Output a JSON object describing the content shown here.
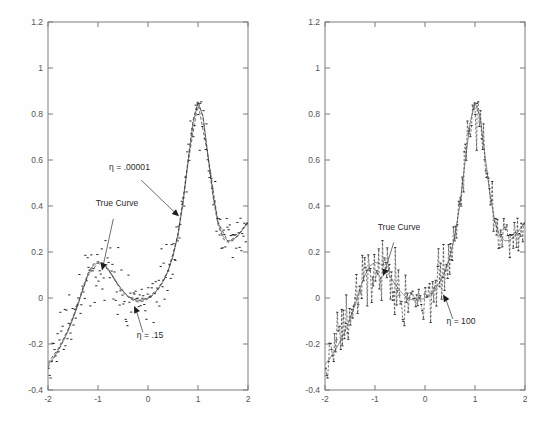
{
  "figure": {
    "title": "",
    "background_color": "#fefefe",
    "panel_count": 2
  },
  "chart_data": [
    {
      "type": "scatter",
      "panel": "left",
      "title": "",
      "xlabel": "",
      "ylabel": "",
      "xlim": [
        -2,
        2
      ],
      "ylim": [
        -0.4,
        1.2
      ],
      "xticks": [
        -2,
        -1,
        0,
        1,
        2
      ],
      "xticklabels": [
        "-2",
        "-1",
        "0",
        "1",
        "2"
      ],
      "yticks": [
        -0.4,
        -0.2,
        0,
        0.2,
        0.4,
        0.6,
        0.8,
        1,
        1.2
      ],
      "yticklabels": [
        "-0.4",
        "-0.2",
        "0",
        "0.2",
        "0.4",
        "0.6",
        "0.8",
        "1",
        "1.2"
      ],
      "grid": false,
      "legend": "none",
      "annotations": [
        {
          "name": "eta-small-label",
          "text": "η = .00001",
          "x": -0.37,
          "y": 0.555,
          "points_to_x": 0.62,
          "points_to_y": 0.355
        },
        {
          "name": "true-curve-label",
          "text": "True Curve",
          "x": -0.62,
          "y": 0.4,
          "points_to_x": -0.92,
          "points_to_y": 0.12
        },
        {
          "name": "eta-mid-label",
          "text": "η = .15",
          "x": 0.04,
          "y": -0.175,
          "points_to_x": -0.28,
          "points_to_y": -0.035
        }
      ],
      "series": [
        {
          "name": "True Curve",
          "style": "solid",
          "color": "#6f6f6f",
          "x": [
            -2.0,
            -1.9,
            -1.8,
            -1.7,
            -1.6,
            -1.5,
            -1.4,
            -1.3,
            -1.2,
            -1.1,
            -1.0,
            -0.9,
            -0.8,
            -0.7,
            -0.6,
            -0.5,
            -0.4,
            -0.3,
            -0.2,
            -0.1,
            0.0,
            0.1,
            0.2,
            0.3,
            0.4,
            0.5,
            0.6,
            0.7,
            0.8,
            0.9,
            1.0,
            1.1,
            1.2,
            1.3,
            1.4,
            1.5,
            1.6,
            1.7,
            1.8,
            1.9,
            2.0
          ],
          "y": [
            -0.29,
            -0.262,
            -0.228,
            -0.19,
            -0.145,
            -0.09,
            -0.03,
            0.04,
            0.1,
            0.14,
            0.155,
            0.15,
            0.128,
            0.095,
            0.06,
            0.03,
            0.008,
            -0.005,
            -0.01,
            -0.008,
            0.0,
            0.015,
            0.038,
            0.07,
            0.115,
            0.18,
            0.275,
            0.41,
            0.59,
            0.76,
            0.85,
            0.79,
            0.62,
            0.45,
            0.33,
            0.268,
            0.248,
            0.252,
            0.272,
            0.3,
            0.33
          ]
        },
        {
          "name": "η = .00001",
          "style": "dashed",
          "color": "#3a3a3a",
          "x": [
            -2.0,
            -1.9,
            -1.8,
            -1.7,
            -1.6,
            -1.5,
            -1.4,
            -1.3,
            -1.2,
            -1.1,
            -1.0,
            -0.9,
            -0.8,
            -0.7,
            -0.6,
            -0.5,
            -0.4,
            -0.3,
            -0.2,
            -0.1,
            0.0,
            0.1,
            0.2,
            0.3,
            0.4,
            0.5,
            0.6,
            0.7,
            0.8,
            0.9,
            1.0,
            1.1,
            1.2,
            1.3,
            1.4,
            1.5,
            1.6,
            1.7,
            1.8,
            1.9,
            2.0
          ],
          "y": [
            -0.3,
            -0.268,
            -0.232,
            -0.188,
            -0.14,
            -0.085,
            -0.022,
            0.048,
            0.108,
            0.146,
            0.16,
            0.152,
            0.126,
            0.09,
            0.054,
            0.024,
            0.004,
            -0.01,
            -0.018,
            -0.014,
            -0.004,
            0.012,
            0.036,
            0.07,
            0.118,
            0.185,
            0.282,
            0.42,
            0.6,
            0.772,
            0.856,
            0.788,
            0.612,
            0.44,
            0.318,
            0.258,
            0.242,
            0.25,
            0.274,
            0.304,
            0.336
          ]
        },
        {
          "name": "η = .15",
          "style": "dashed",
          "color": "#3a3a3a",
          "x": [
            -2.0,
            -1.8,
            -1.6,
            -1.4,
            -1.2,
            -1.0,
            -0.8,
            -0.6,
            -0.4,
            -0.2,
            0.0,
            0.2,
            0.4,
            0.6,
            0.8,
            1.0,
            1.2,
            1.4,
            1.6,
            1.8,
            2.0
          ],
          "y": [
            -0.282,
            -0.222,
            -0.138,
            -0.025,
            0.098,
            0.152,
            0.124,
            0.058,
            0.006,
            -0.014,
            0.002,
            0.04,
            0.118,
            0.272,
            0.588,
            0.846,
            0.618,
            0.33,
            0.246,
            0.27,
            0.328
          ]
        }
      ],
      "scatter_points": {
        "count": 200,
        "noise_sigma": 0.06,
        "description": "noisy observations around true curve, x uniform on [-2,2]"
      }
    },
    {
      "type": "scatter",
      "panel": "right",
      "title": "",
      "xlabel": "",
      "ylabel": "",
      "xlim": [
        -2,
        2
      ],
      "ylim": [
        -0.4,
        1.2
      ],
      "xticks": [
        -2,
        -1,
        0,
        1,
        2
      ],
      "xticklabels": [
        "-2",
        "-1",
        "0",
        "1",
        "2"
      ],
      "yticks": [
        -0.4,
        -0.2,
        0,
        0.2,
        0.4,
        0.6,
        0.8,
        1,
        1.2
      ],
      "yticklabels": [
        "-0.4",
        "-0.2",
        "0",
        "0.2",
        "0.4",
        "0.6",
        "0.8",
        "1",
        "1.2"
      ],
      "grid": false,
      "legend": "none",
      "annotations": [
        {
          "name": "true-curve-label",
          "text": "True Curve",
          "x": -0.52,
          "y": 0.295,
          "points_to_x": -0.84,
          "points_to_y": 0.095
        },
        {
          "name": "eta-large-label",
          "text": "η = 100",
          "x": 0.72,
          "y": -0.115,
          "points_to_x": 0.36,
          "points_to_y": 0.015
        }
      ],
      "series": [
        {
          "name": "True Curve",
          "style": "solid",
          "color": "#6f6f6f",
          "x": [
            -2.0,
            -1.9,
            -1.8,
            -1.7,
            -1.6,
            -1.5,
            -1.4,
            -1.3,
            -1.2,
            -1.1,
            -1.0,
            -0.9,
            -0.8,
            -0.7,
            -0.6,
            -0.5,
            -0.4,
            -0.3,
            -0.2,
            -0.1,
            0.0,
            0.1,
            0.2,
            0.3,
            0.4,
            0.5,
            0.6,
            0.7,
            0.8,
            0.9,
            1.0,
            1.1,
            1.2,
            1.3,
            1.4,
            1.5,
            1.6,
            1.7,
            1.8,
            1.9,
            2.0
          ],
          "y": [
            -0.29,
            -0.262,
            -0.228,
            -0.19,
            -0.145,
            -0.09,
            -0.03,
            0.04,
            0.1,
            0.14,
            0.155,
            0.15,
            0.128,
            0.095,
            0.06,
            0.03,
            0.008,
            -0.005,
            -0.01,
            -0.008,
            0.0,
            0.015,
            0.038,
            0.07,
            0.115,
            0.18,
            0.275,
            0.41,
            0.59,
            0.76,
            0.85,
            0.79,
            0.62,
            0.45,
            0.33,
            0.268,
            0.248,
            0.252,
            0.272,
            0.3,
            0.33
          ]
        },
        {
          "name": "η = 100",
          "style": "rough-interpolating",
          "color": "#3a3a3a",
          "description": "near-interpolating wiggly fit passing through nearly every noisy observation"
        }
      ],
      "scatter_points": {
        "count": 200,
        "noise_sigma": 0.06,
        "description": "same noisy observations as left panel"
      }
    }
  ]
}
